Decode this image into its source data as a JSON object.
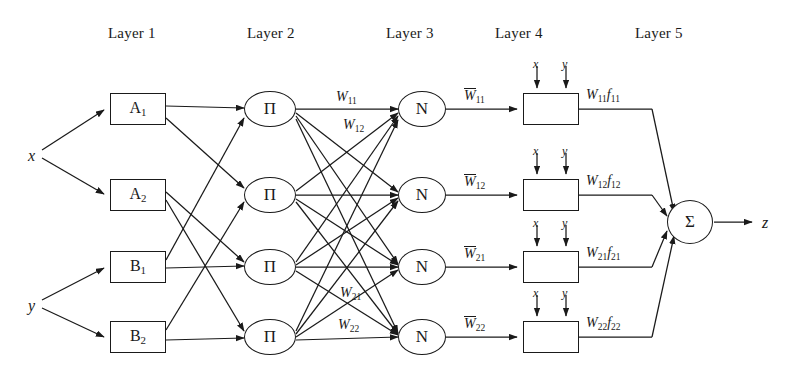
{
  "diagram": {
    "layer_titles": [
      {
        "label": "Layer 1",
        "x": 108,
        "y": 26
      },
      {
        "label": "Layer 2",
        "x": 247,
        "y": 26
      },
      {
        "label": "Layer 3",
        "x": 386,
        "y": 26
      },
      {
        "label": "Layer 4",
        "x": 495,
        "y": 26
      },
      {
        "label": "Layer 5",
        "x": 635,
        "y": 26
      }
    ],
    "inputs": [
      {
        "name": "input-x",
        "label": "x",
        "x": 28,
        "y": 148
      },
      {
        "name": "input-y",
        "label": "y",
        "x": 28,
        "y": 298
      }
    ],
    "output": {
      "name": "output-z",
      "label": "z",
      "x": 762,
      "y": 215
    },
    "layer1_nodes": [
      {
        "id": "A1",
        "base": "A",
        "sub": "1",
        "x": 110,
        "y": 93,
        "w": 56,
        "h": 32
      },
      {
        "id": "A2",
        "base": "A",
        "sub": "2",
        "x": 110,
        "y": 179,
        "w": 56,
        "h": 32
      },
      {
        "id": "B1",
        "base": "B",
        "sub": "1",
        "x": 110,
        "y": 251,
        "w": 56,
        "h": 32
      },
      {
        "id": "B2",
        "base": "B",
        "sub": "2",
        "x": 110,
        "y": 321,
        "w": 56,
        "h": 32
      }
    ],
    "layer2_nodes": [
      {
        "id": "P1",
        "symbol": "Π",
        "cx": 270,
        "cy": 109
      },
      {
        "id": "P2",
        "symbol": "Π",
        "cx": 270,
        "cy": 195
      },
      {
        "id": "P3",
        "symbol": "Π",
        "cx": 270,
        "cy": 267
      },
      {
        "id": "P4",
        "symbol": "Π",
        "cx": 270,
        "cy": 337
      }
    ],
    "layer3_nodes": [
      {
        "id": "N1",
        "symbol": "N",
        "cx": 422,
        "cy": 109
      },
      {
        "id": "N2",
        "symbol": "N",
        "cx": 422,
        "cy": 195
      },
      {
        "id": "N3",
        "symbol": "N",
        "cx": 422,
        "cy": 267
      },
      {
        "id": "N4",
        "symbol": "N",
        "cx": 422,
        "cy": 337
      }
    ],
    "layer4_nodes": [
      {
        "id": "F1",
        "x": 523,
        "y": 93,
        "w": 56,
        "h": 32
      },
      {
        "id": "F2",
        "x": 523,
        "y": 179,
        "w": 56,
        "h": 32
      },
      {
        "id": "F3",
        "x": 523,
        "y": 251,
        "w": 56,
        "h": 32
      },
      {
        "id": "F4",
        "x": 523,
        "y": 321,
        "w": 56,
        "h": 32
      }
    ],
    "layer5_node": {
      "id": "SUM",
      "symbol": "Σ",
      "cx": 690,
      "cy": 222,
      "rx": 23,
      "ry": 22
    },
    "layer4_input_labels": [
      {
        "label": "x",
        "x": 533,
        "y": 60
      },
      {
        "label": "y",
        "x": 562,
        "y": 60
      },
      {
        "label": "x",
        "x": 533,
        "y": 147
      },
      {
        "label": "y",
        "x": 562,
        "y": 147
      },
      {
        "label": "x",
        "x": 533,
        "y": 219
      },
      {
        "label": "y",
        "x": 562,
        "y": 219
      },
      {
        "label": "x",
        "x": 533,
        "y": 289
      },
      {
        "label": "y",
        "x": 562,
        "y": 289
      }
    ],
    "weights_layer2": [
      {
        "id": "W11",
        "base": "W",
        "sub": "11",
        "x": 336,
        "y": 92
      },
      {
        "id": "W12",
        "base": "W",
        "sub": "12",
        "x": 343,
        "y": 120
      },
      {
        "id": "W21",
        "base": "W",
        "sub": "21",
        "x": 340,
        "y": 288
      },
      {
        "id": "W22",
        "base": "W",
        "sub": "22",
        "x": 338,
        "y": 320
      }
    ],
    "weights_layer3": [
      {
        "id": "Wbar11",
        "base": "W",
        "sub": "11",
        "x": 464,
        "y": 90
      },
      {
        "id": "Wbar12",
        "base": "W",
        "sub": "12",
        "x": 464,
        "y": 176
      },
      {
        "id": "Wbar21",
        "base": "W",
        "sub": "21",
        "x": 464,
        "y": 248
      },
      {
        "id": "Wbar22",
        "base": "W",
        "sub": "22",
        "x": 464,
        "y": 318
      }
    ],
    "weights_layer4": [
      {
        "id": "Wf11",
        "base": "W",
        "sub": "11",
        "fbase": "f",
        "fsub": "11",
        "x": 586,
        "y": 90
      },
      {
        "id": "Wf12",
        "base": "W",
        "sub": "12",
        "fbase": "f",
        "fsub": "12",
        "x": 586,
        "y": 176
      },
      {
        "id": "Wf21",
        "base": "W",
        "sub": "21",
        "fbase": "f",
        "fsub": "21",
        "x": 586,
        "y": 248
      },
      {
        "id": "Wf22",
        "base": "W",
        "sub": "22",
        "fbase": "f",
        "fsub": "22",
        "x": 586,
        "y": 318
      }
    ],
    "colors": {
      "stroke": "#1a1a1a",
      "background": "#ffffff"
    }
  }
}
